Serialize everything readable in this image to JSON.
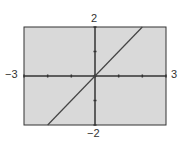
{
  "chart_data": {
    "type": "line",
    "title": "",
    "xlabel": "",
    "ylabel": "",
    "xlim": [
      -3,
      3
    ],
    "ylim": [
      -2,
      2
    ],
    "x_tick_step": 1,
    "y_tick_step": 1,
    "grid": false,
    "series": [
      {
        "name": "y = x",
        "x": [
          -2,
          2
        ],
        "y": [
          -2,
          2
        ]
      }
    ],
    "labels": {
      "xmin": "−3",
      "xmax": "3",
      "ymin": "−2",
      "ymax": "2"
    }
  },
  "colors": {
    "plot_bg": "#d9d9d9",
    "axis": "#333333",
    "line": "#444444",
    "frame": "#333333"
  }
}
